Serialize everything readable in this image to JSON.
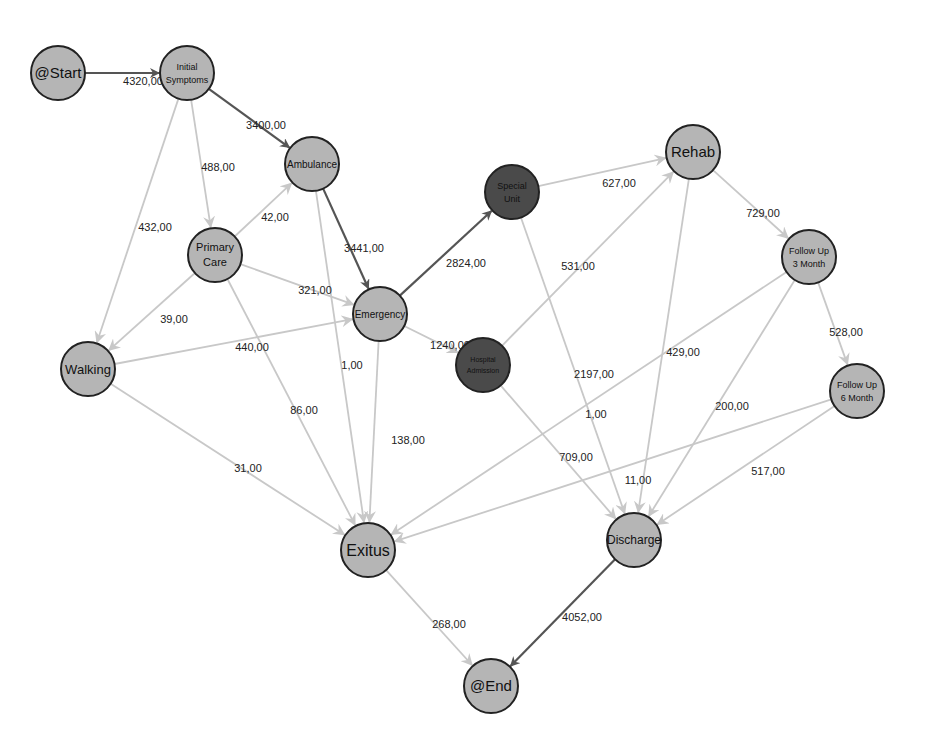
{
  "colors": {
    "background": "#ffffff",
    "node_fill": "#b5b5b5",
    "node_fill_dark": "#4a4a4a",
    "node_stroke": "#222222",
    "edge_strong": "#555555",
    "edge_light": "#c8c8c8",
    "label_text": "#222222"
  },
  "nodes": [
    {
      "id": "start",
      "lines": [
        "@Start"
      ],
      "x": 58,
      "y": 73,
      "dark": false,
      "size": 15
    },
    {
      "id": "initial",
      "lines": [
        "Initial",
        "Symptoms"
      ],
      "x": 187,
      "y": 73,
      "dark": false,
      "size": 9
    },
    {
      "id": "ambulance",
      "lines": [
        "Ambulance"
      ],
      "x": 312,
      "y": 164,
      "dark": false,
      "size": 10
    },
    {
      "id": "primary",
      "lines": [
        "Primary",
        "Care"
      ],
      "x": 215,
      "y": 255,
      "dark": false,
      "size": 11
    },
    {
      "id": "walking",
      "lines": [
        "Walking"
      ],
      "x": 88,
      "y": 369,
      "dark": false,
      "size": 13
    },
    {
      "id": "emergency",
      "lines": [
        "Emergency"
      ],
      "x": 380,
      "y": 314,
      "dark": false,
      "size": 10
    },
    {
      "id": "special",
      "lines": [
        "Special",
        "Unit"
      ],
      "x": 512,
      "y": 192,
      "dark": true,
      "size": 9
    },
    {
      "id": "hospital",
      "lines": [
        "Hospital",
        "Admission"
      ],
      "x": 483,
      "y": 365,
      "dark": true,
      "size": 7
    },
    {
      "id": "rehab",
      "lines": [
        "Rehab"
      ],
      "x": 693,
      "y": 152,
      "dark": false,
      "size": 15
    },
    {
      "id": "fu3",
      "lines": [
        "Follow Up",
        "3 Month"
      ],
      "x": 809,
      "y": 257,
      "dark": false,
      "size": 9
    },
    {
      "id": "fu6",
      "lines": [
        "Follow Up",
        "6 Month"
      ],
      "x": 857,
      "y": 391,
      "dark": false,
      "size": 9
    },
    {
      "id": "exitus",
      "lines": [
        "Exitus"
      ],
      "x": 368,
      "y": 550,
      "dark": false,
      "size": 16
    },
    {
      "id": "discharge",
      "lines": [
        "Discharge"
      ],
      "x": 634,
      "y": 540,
      "dark": false,
      "size": 12
    },
    {
      "id": "end",
      "lines": [
        "@End"
      ],
      "x": 491,
      "y": 686,
      "dark": false,
      "size": 15
    }
  ],
  "edges": [
    {
      "from": "start",
      "to": "initial",
      "label": "4320,00",
      "strong": true,
      "lx": 143,
      "ly": 85
    },
    {
      "from": "initial",
      "to": "ambulance",
      "label": "3400,00",
      "strong": true,
      "lx": 266,
      "ly": 129
    },
    {
      "from": "initial",
      "to": "primary",
      "label": "488,00",
      "strong": false,
      "lx": 218,
      "ly": 171
    },
    {
      "from": "initial",
      "to": "walking",
      "label": "432,00",
      "strong": false,
      "lx": 155,
      "ly": 231
    },
    {
      "from": "primary",
      "to": "ambulance",
      "label": "42,00",
      "strong": false,
      "lx": 275,
      "ly": 221
    },
    {
      "from": "primary",
      "to": "emergency",
      "label": "321,00",
      "strong": false,
      "lx": 315,
      "ly": 294
    },
    {
      "from": "primary",
      "to": "walking",
      "label": "39,00",
      "strong": false,
      "lx": 174,
      "ly": 323
    },
    {
      "from": "primary",
      "to": "exitus",
      "label": "86,00",
      "strong": false,
      "lx": 304,
      "ly": 414
    },
    {
      "from": "ambulance",
      "to": "emergency",
      "label": "3441,00",
      "strong": true,
      "lx": 364,
      "ly": 252
    },
    {
      "from": "ambulance",
      "to": "exitus",
      "label": "1,00",
      "strong": false,
      "lx": 352,
      "ly": 369
    },
    {
      "from": "walking",
      "to": "emergency",
      "label": "440,00",
      "strong": false,
      "lx": 252,
      "ly": 351
    },
    {
      "from": "walking",
      "to": "exitus",
      "label": "31,00",
      "strong": false,
      "lx": 248,
      "ly": 472
    },
    {
      "from": "emergency",
      "to": "special",
      "label": "2824,00",
      "strong": true,
      "lx": 466,
      "ly": 267
    },
    {
      "from": "emergency",
      "to": "hospital",
      "label": "1240,00",
      "strong": false,
      "lx": 450,
      "ly": 349
    },
    {
      "from": "emergency",
      "to": "exitus",
      "label": "138,00",
      "strong": false,
      "lx": 408,
      "ly": 444
    },
    {
      "from": "special",
      "to": "rehab",
      "label": "627,00",
      "strong": false,
      "lx": 619,
      "ly": 187
    },
    {
      "from": "special",
      "to": "discharge",
      "label": "2197,00",
      "strong": false,
      "lx": 594,
      "ly": 378
    },
    {
      "from": "hospital",
      "to": "rehab",
      "label": "531,00",
      "strong": false,
      "lx": 578,
      "ly": 270
    },
    {
      "from": "hospital",
      "to": "discharge",
      "label": "709,00",
      "strong": false,
      "lx": 576,
      "ly": 461
    },
    {
      "from": "rehab",
      "to": "fu3",
      "label": "729,00",
      "strong": false,
      "lx": 763,
      "ly": 217
    },
    {
      "from": "rehab",
      "to": "discharge",
      "label": "11,00",
      "strong": false,
      "lx": 638,
      "ly": 484
    },
    {
      "from": "fu3",
      "to": "fu6",
      "label": "528,00",
      "strong": false,
      "lx": 846,
      "ly": 336
    },
    {
      "from": "fu3",
      "to": "exitus",
      "label": "429,00",
      "strong": false,
      "lx": 683,
      "ly": 356
    },
    {
      "from": "fu3",
      "to": "discharge",
      "label": "200,00",
      "strong": false,
      "lx": 732,
      "ly": 410
    },
    {
      "from": "fu6",
      "to": "exitus",
      "label": "1,00",
      "strong": false,
      "lx": 596,
      "ly": 418
    },
    {
      "from": "fu6",
      "to": "discharge",
      "label": "517,00",
      "strong": false,
      "lx": 768,
      "ly": 475
    },
    {
      "from": "exitus",
      "to": "end",
      "label": "268,00",
      "strong": false,
      "lx": 449,
      "ly": 628
    },
    {
      "from": "discharge",
      "to": "end",
      "label": "4052,00",
      "strong": true,
      "lx": 582,
      "ly": 621
    }
  ]
}
